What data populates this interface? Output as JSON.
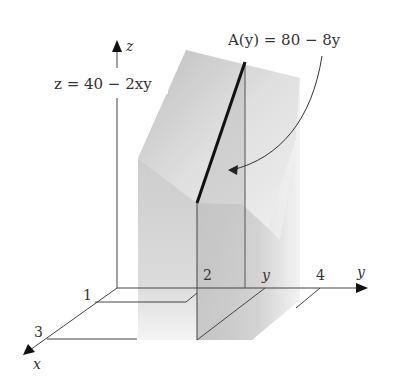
{
  "figure": {
    "type": "3d-solid-cross-section",
    "axes": {
      "z_label": "z",
      "y_label": "y",
      "x_label": "x"
    },
    "tick_labels": {
      "x1": "1",
      "x3": "3",
      "y2": "2",
      "y4": "4",
      "y_var": "y"
    },
    "surface_equation": "z = 40 − 2xy",
    "area_equation": "A(y) = 80 − 8y",
    "colors": {
      "axis": "#444444",
      "solid_light": "#e8e8e8",
      "solid_mid": "#c4c4c4",
      "solid_dark": "#a8a8a8",
      "cross_section_edge": "#111111"
    }
  }
}
